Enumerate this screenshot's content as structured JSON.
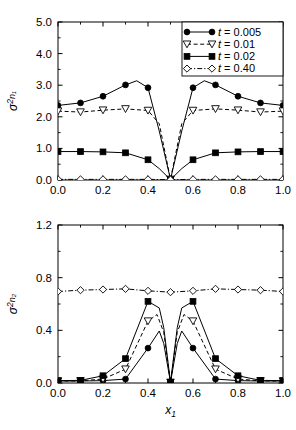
{
  "figure": {
    "background": "#ffffff",
    "line_color": "#000000"
  },
  "chart_data": [
    {
      "type": "line",
      "panel": "top",
      "title": "",
      "xlabel": "",
      "ylabel": "σ²n₁",
      "ylabel_parts": {
        "symbol": "σ",
        "superscript": "2",
        "subscript": "n₁"
      },
      "xlim": [
        0.0,
        1.0
      ],
      "ylim": [
        0.0,
        5.0
      ],
      "xticks": [
        0.0,
        0.2,
        0.4,
        0.6,
        0.8,
        1.0
      ],
      "xticklabels": [
        "0.0",
        "0.2",
        "0.4",
        "0.6",
        "0.8",
        "1.0"
      ],
      "yticks": [
        0.0,
        1.0,
        2.0,
        3.0,
        4.0,
        5.0
      ],
      "yticklabels": [
        "0.0",
        "1.0",
        "2.0",
        "3.0",
        "4.0",
        "5.0"
      ],
      "minor_xticks": [
        0.1,
        0.3,
        0.5,
        0.7,
        0.9
      ],
      "minor_yticks": [
        0.5,
        1.5,
        2.5,
        3.5,
        4.5
      ],
      "grid": false,
      "legend_position": "upper right",
      "series": [
        {
          "name": "t = 0.005",
          "marker": "filled-circle",
          "linestyle": "solid",
          "x": [
            0.0,
            0.1,
            0.2,
            0.3,
            0.35,
            0.4,
            0.45,
            0.5,
            0.55,
            0.6,
            0.65,
            0.7,
            0.8,
            0.9,
            1.0
          ],
          "y": [
            2.36,
            2.44,
            2.65,
            3.01,
            3.14,
            2.92,
            1.55,
            0.02,
            1.55,
            2.92,
            3.14,
            3.01,
            2.65,
            2.44,
            2.36
          ]
        },
        {
          "name": "t = 0.01",
          "marker": "open-triangle-down",
          "linestyle": "dashed",
          "x": [
            0.0,
            0.1,
            0.2,
            0.3,
            0.4,
            0.45,
            0.5,
            0.55,
            0.6,
            0.7,
            0.8,
            0.9,
            1.0
          ],
          "y": [
            2.18,
            2.15,
            2.21,
            2.25,
            2.2,
            1.78,
            0.02,
            1.78,
            2.2,
            2.25,
            2.21,
            2.15,
            2.18
          ]
        },
        {
          "name": "t = 0.02",
          "marker": "filled-square",
          "linestyle": "solid",
          "x": [
            0.0,
            0.1,
            0.2,
            0.3,
            0.4,
            0.45,
            0.5,
            0.55,
            0.6,
            0.7,
            0.8,
            0.9,
            1.0
          ],
          "y": [
            0.9,
            0.9,
            0.89,
            0.86,
            0.64,
            0.36,
            0.01,
            0.36,
            0.64,
            0.86,
            0.89,
            0.9,
            0.9
          ]
        },
        {
          "name": "t = 0.40",
          "marker": "open-diamond",
          "linestyle": "dashdot",
          "x": [
            0.0,
            0.1,
            0.2,
            0.3,
            0.4,
            0.5,
            0.6,
            0.7,
            0.8,
            0.9,
            1.0
          ],
          "y": [
            0.02,
            0.02,
            0.02,
            0.02,
            0.02,
            0.01,
            0.02,
            0.02,
            0.02,
            0.02,
            0.02
          ]
        }
      ]
    },
    {
      "type": "line",
      "panel": "bottom",
      "title": "",
      "xlabel": "x₁",
      "ylabel": "σ²n₂",
      "ylabel_parts": {
        "symbol": "σ",
        "superscript": "2",
        "subscript": "n₂"
      },
      "xlim": [
        0.0,
        1.0
      ],
      "ylim": [
        0.0,
        1.2
      ],
      "xticks": [
        0.0,
        0.2,
        0.4,
        0.6,
        0.8,
        1.0
      ],
      "xticklabels": [
        "0.0",
        "0.2",
        "0.4",
        "0.6",
        "0.8",
        "1.0"
      ],
      "yticks": [
        0.0,
        0.4,
        0.8,
        1.2
      ],
      "yticklabels": [
        "0.0",
        "0.4",
        "0.8",
        "1.2"
      ],
      "minor_xticks": [
        0.1,
        0.3,
        0.5,
        0.7,
        0.9
      ],
      "minor_yticks": [
        0.2,
        0.6,
        1.0
      ],
      "grid": false,
      "legend_position": "none",
      "series": [
        {
          "name": "t = 0.005",
          "marker": "filled-circle",
          "linestyle": "solid",
          "x": [
            0.0,
            0.1,
            0.2,
            0.3,
            0.4,
            0.45,
            0.47,
            0.5,
            0.53,
            0.55,
            0.6,
            0.7,
            0.8,
            0.9,
            1.0
          ],
          "y": [
            0.015,
            0.015,
            0.018,
            0.03,
            0.265,
            0.395,
            0.3,
            0.005,
            0.3,
            0.395,
            0.265,
            0.03,
            0.018,
            0.015,
            0.015
          ]
        },
        {
          "name": "t = 0.01",
          "marker": "open-triangle-down",
          "linestyle": "dashed",
          "x": [
            0.0,
            0.1,
            0.2,
            0.3,
            0.4,
            0.44,
            0.47,
            0.5,
            0.53,
            0.56,
            0.6,
            0.7,
            0.8,
            0.9,
            1.0
          ],
          "y": [
            0.015,
            0.016,
            0.03,
            0.105,
            0.47,
            0.52,
            0.385,
            0.005,
            0.385,
            0.52,
            0.47,
            0.105,
            0.03,
            0.016,
            0.015
          ]
        },
        {
          "name": "t = 0.02",
          "marker": "filled-square",
          "linestyle": "solid",
          "x": [
            0.0,
            0.1,
            0.2,
            0.3,
            0.4,
            0.45,
            0.47,
            0.5,
            0.53,
            0.55,
            0.6,
            0.7,
            0.8,
            0.9,
            1.0
          ],
          "y": [
            0.018,
            0.02,
            0.055,
            0.185,
            0.62,
            0.57,
            0.42,
            0.005,
            0.42,
            0.57,
            0.62,
            0.185,
            0.055,
            0.02,
            0.018
          ]
        },
        {
          "name": "t = 0.40",
          "marker": "open-diamond",
          "linestyle": "dashdot",
          "x": [
            0.0,
            0.1,
            0.2,
            0.3,
            0.4,
            0.5,
            0.6,
            0.7,
            0.8,
            0.9,
            1.0
          ],
          "y": [
            0.695,
            0.705,
            0.71,
            0.715,
            0.7,
            0.69,
            0.7,
            0.715,
            0.71,
            0.705,
            0.695
          ]
        }
      ]
    }
  ],
  "legend": {
    "items": [
      {
        "label_var": "t",
        "label_value": "= 0.005",
        "marker": "filled-circle",
        "linestyle": "solid"
      },
      {
        "label_var": "t",
        "label_value": "= 0.01",
        "marker": "open-triangle-down",
        "linestyle": "dashed"
      },
      {
        "label_var": "t",
        "label_value": "= 0.02",
        "marker": "filled-square",
        "linestyle": "solid"
      },
      {
        "label_var": "t",
        "label_value": "= 0.40",
        "marker": "open-diamond",
        "linestyle": "dashdot"
      }
    ]
  }
}
